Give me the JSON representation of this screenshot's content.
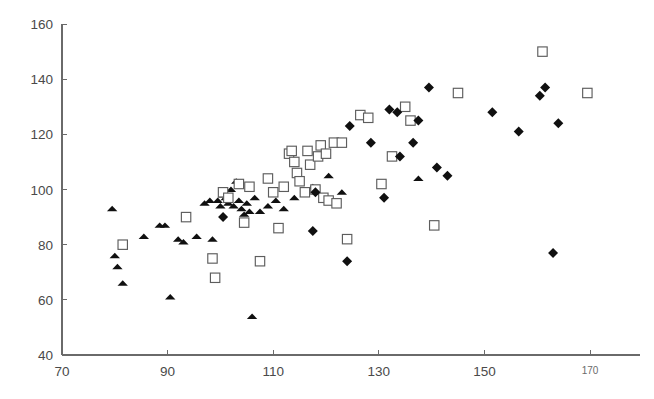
{
  "chart_data": {
    "type": "scatter",
    "title": "",
    "subtitle": "",
    "xlabel": "",
    "ylabel": "",
    "xlim": [
      70,
      180
    ],
    "ylim": [
      40,
      160
    ],
    "xticks": [
      70,
      90,
      110,
      130,
      150,
      170
    ],
    "yticks": [
      40,
      60,
      80,
      100,
      120,
      140,
      160
    ],
    "xtick_labels": [
      "70",
      "90",
      "110",
      "130",
      "150",
      "170"
    ],
    "ytick_labels": [
      "40",
      "60",
      "80",
      "100",
      "120",
      "140",
      "160"
    ],
    "grid": false,
    "legend": "none",
    "axes_style": "left-and-bottom-spines",
    "series": [
      {
        "name": "filled-triangles",
        "marker": "triangle",
        "fill": "#101010",
        "points": [
          [
            79.5,
            93
          ],
          [
            80.0,
            76
          ],
          [
            80.5,
            72
          ],
          [
            81.5,
            66
          ],
          [
            85.5,
            83
          ],
          [
            88.5,
            87
          ],
          [
            89.5,
            87
          ],
          [
            90.5,
            61
          ],
          [
            92.0,
            82
          ],
          [
            93.0,
            81
          ],
          [
            95.5,
            83
          ],
          [
            97.0,
            95
          ],
          [
            98.0,
            96
          ],
          [
            98.5,
            82
          ],
          [
            99.5,
            96
          ],
          [
            100.0,
            94
          ],
          [
            100.5,
            98
          ],
          [
            101.0,
            97
          ],
          [
            101.5,
            95
          ],
          [
            102.0,
            100
          ],
          [
            102.5,
            94
          ],
          [
            103.0,
            103
          ],
          [
            103.5,
            96
          ],
          [
            104.0,
            93
          ],
          [
            104.5,
            91
          ],
          [
            105.0,
            95
          ],
          [
            105.5,
            92
          ],
          [
            106.0,
            54
          ],
          [
            106.5,
            97
          ],
          [
            107.5,
            92
          ],
          [
            109.0,
            94
          ],
          [
            110.5,
            96
          ],
          [
            112.0,
            93
          ],
          [
            114.0,
            97
          ],
          [
            117.5,
            101
          ],
          [
            120.5,
            105
          ],
          [
            123.0,
            99
          ],
          [
            137.5,
            104
          ]
        ]
      },
      {
        "name": "open-squares",
        "marker": "square",
        "fill": "#ffffff",
        "stroke": "#5d5d5d",
        "points": [
          [
            81.5,
            80
          ],
          [
            93.5,
            90
          ],
          [
            98.5,
            75
          ],
          [
            99.0,
            68
          ],
          [
            100.5,
            99
          ],
          [
            101.5,
            97
          ],
          [
            103.5,
            102
          ],
          [
            104.5,
            88
          ],
          [
            105.5,
            101
          ],
          [
            107.5,
            74
          ],
          [
            109.0,
            104
          ],
          [
            110.0,
            99
          ],
          [
            111.0,
            86
          ],
          [
            112.0,
            101
          ],
          [
            113.0,
            113
          ],
          [
            113.5,
            114
          ],
          [
            114.0,
            110
          ],
          [
            114.5,
            106
          ],
          [
            115.0,
            103
          ],
          [
            116.0,
            99
          ],
          [
            116.5,
            114
          ],
          [
            117.0,
            109
          ],
          [
            118.0,
            100
          ],
          [
            118.5,
            112
          ],
          [
            119.0,
            116
          ],
          [
            119.5,
            97
          ],
          [
            120.0,
            113
          ],
          [
            120.5,
            96
          ],
          [
            121.5,
            117
          ],
          [
            122.0,
            95
          ],
          [
            123.0,
            117
          ],
          [
            124.0,
            82
          ],
          [
            126.5,
            127
          ],
          [
            128.0,
            126
          ],
          [
            130.5,
            102
          ],
          [
            132.5,
            112
          ],
          [
            135.0,
            130
          ],
          [
            136.0,
            125
          ],
          [
            140.5,
            87
          ],
          [
            145.0,
            135
          ],
          [
            161.0,
            150
          ],
          [
            169.5,
            135
          ]
        ]
      },
      {
        "name": "filled-diamonds",
        "marker": "diamond",
        "fill": "#101010",
        "points": [
          [
            100.5,
            90
          ],
          [
            117.5,
            85
          ],
          [
            118.0,
            99
          ],
          [
            124.0,
            74
          ],
          [
            124.5,
            123
          ],
          [
            128.5,
            117
          ],
          [
            131.0,
            97
          ],
          [
            132.0,
            129
          ],
          [
            133.5,
            128
          ],
          [
            134.0,
            112
          ],
          [
            136.5,
            117
          ],
          [
            137.5,
            125
          ],
          [
            139.5,
            137
          ],
          [
            141.0,
            108
          ],
          [
            143.0,
            105
          ],
          [
            151.5,
            128
          ],
          [
            156.5,
            121
          ],
          [
            160.5,
            134
          ],
          [
            161.5,
            137
          ],
          [
            163.0,
            77
          ],
          [
            164.0,
            124
          ]
        ]
      }
    ]
  },
  "axes_geometry": {
    "x_origin_px": 62,
    "y_origin_px": 355,
    "x_scale_px_per_unit": 5.28,
    "y_scale_px_per_unit": 2.758,
    "x_axis_end_px": 640,
    "y_axis_top_px": 24
  }
}
